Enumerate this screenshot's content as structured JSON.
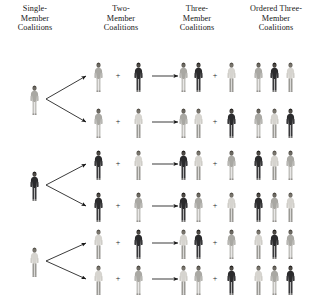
{
  "figure": {
    "background_color": "#ffffff",
    "ink_color": "#1a1a1a"
  },
  "columns": [
    {
      "id": "single",
      "label": "Single-\nMember\nCoalitions",
      "line1": "Single-",
      "line2": "Member",
      "line3": "Coalitions",
      "center_x": 34,
      "top_y": 4
    },
    {
      "id": "two",
      "label": "Two-\nMember\nCoalitions",
      "line1": "Two-",
      "line2": "Member",
      "line3": "Coalitions",
      "center_x": 120,
      "top_y": 4
    },
    {
      "id": "three",
      "label": "Three-\nMember\nCoalitions",
      "line1": "Three-",
      "line2": "Member",
      "line3": "Coalitions",
      "center_x": 196,
      "top_y": 4
    },
    {
      "id": "ordered",
      "label": "Ordered Three-\nMember\nCoalitions",
      "line1": "Ordered Three-",
      "line2": "Member",
      "line3": "Coalitions",
      "center_x": 274,
      "top_y": 4
    }
  ],
  "actors": {
    "A": {
      "name": "person-a-light-gray",
      "tone": "light",
      "body_color": "#b9b8b4",
      "torso_color": "#a9a8a3",
      "head_color": "#6d6a63",
      "hair_color": "#4a463f",
      "legs_color": "#c2c1bd"
    },
    "B": {
      "name": "person-b-dark-suit",
      "tone": "dark",
      "body_color": "#3a3a3c",
      "torso_color": "#2b2b2d",
      "head_color": "#4f4b46",
      "hair_color": "#1f1d1b",
      "legs_color": "#38383a"
    },
    "C": {
      "name": "person-c-light-suit",
      "tone": "medium",
      "body_color": "#cfcdc8",
      "torso_color": "#d6d4cf",
      "head_color": "#7a766e",
      "hair_color": "#55514a",
      "legs_color": "#9b9a95"
    }
  },
  "rows": [
    {
      "index": 0,
      "y": 76,
      "single": "A",
      "two": [
        "A",
        "B"
      ],
      "three": [
        "A",
        "B",
        "C"
      ],
      "ordered": [
        "A",
        "B",
        "C"
      ]
    },
    {
      "index": 1,
      "y": 122,
      "single": "A",
      "two": [
        "A",
        "C"
      ],
      "three": [
        "A",
        "C",
        "B"
      ],
      "ordered": [
        "A",
        "C",
        "B"
      ]
    },
    {
      "index": 2,
      "y": 164,
      "single": "B",
      "two": [
        "B",
        "C"
      ],
      "three": [
        "B",
        "C",
        "A"
      ],
      "ordered": [
        "B",
        "C",
        "A"
      ]
    },
    {
      "index": 3,
      "y": 206,
      "single": "B",
      "two": [
        "B",
        "A"
      ],
      "three": [
        "B",
        "A",
        "C"
      ],
      "ordered": [
        "B",
        "A",
        "C"
      ]
    },
    {
      "index": 4,
      "y": 243,
      "single": "C",
      "two": [
        "C",
        "B"
      ],
      "three": [
        "C",
        "B",
        "A"
      ],
      "ordered": [
        "C",
        "B",
        "A"
      ]
    },
    {
      "index": 5,
      "y": 279,
      "single": "C",
      "two": [
        "C",
        "A"
      ],
      "three": [
        "C",
        "A",
        "B"
      ],
      "ordered": [
        "C",
        "A",
        "B"
      ]
    }
  ],
  "branches": [
    {
      "source_row": 0,
      "source_y": 99,
      "targets": [
        76,
        122
      ]
    },
    {
      "source_row": 2,
      "source_y": 185,
      "targets": [
        164,
        206
      ]
    },
    {
      "source_row": 4,
      "source_y": 261,
      "targets": [
        243,
        279
      ]
    }
  ],
  "glyphs": {
    "plus": "+",
    "arrow": "horizontal-arrow-right",
    "branch_arrow": "diagonal-arrow"
  },
  "layout": {
    "single_x": 34,
    "two_first_x": 98,
    "two_plus_x": 118,
    "two_second_x": 138,
    "arrow_x1": 152,
    "arrow_x2": 178,
    "three_first_x": 183,
    "three_second_x": 198,
    "three_plus_x": 215,
    "three_third_x": 231,
    "ordered_first_x": 258,
    "ordered_second_x": 274,
    "ordered_third_x": 290,
    "figure_w": 13,
    "figure_h": 31
  }
}
